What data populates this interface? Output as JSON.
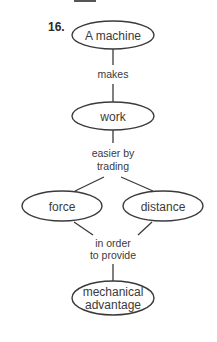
{
  "question_number": "16.",
  "nodes": {
    "machine": "A machine",
    "work": "work",
    "force": "force",
    "distance": "distance",
    "mechanical_1": "mechanical",
    "mechanical_2": "advantage"
  },
  "links": {
    "makes": "makes",
    "easier_1": "easier by",
    "easier_2": "trading",
    "order_1": "in order",
    "order_2": "to provide"
  },
  "colors": {
    "stroke": "#3a3a3a",
    "text": "#3a3a3a"
  }
}
